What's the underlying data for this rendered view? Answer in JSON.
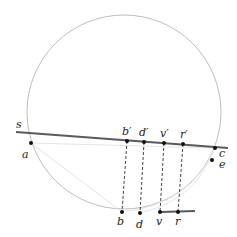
{
  "diagram": {
    "type": "geometric-construction",
    "circle": {
      "cx": 124,
      "cy": 112,
      "r": 97,
      "stroke": "#bdbdbd"
    },
    "thick_lines": [
      {
        "name": "tangent-line-s",
        "x1": 16,
        "y1": 132,
        "x2": 228,
        "y2": 148,
        "stroke": "#5a5a5a"
      },
      {
        "name": "base-segment-vr",
        "x1": 160,
        "y1": 212,
        "x2": 195,
        "y2": 211,
        "stroke": "#5a5a5a"
      }
    ],
    "points": [
      {
        "id": "a",
        "label": "a",
        "x": 31,
        "y": 143,
        "lx": 22,
        "ly": 158
      },
      {
        "id": "b_prime",
        "label": "b′",
        "x": 127,
        "y": 141,
        "lx": 122,
        "ly": 135
      },
      {
        "id": "d_prime",
        "label": "d′",
        "x": 144,
        "y": 142,
        "lx": 139,
        "ly": 136
      },
      {
        "id": "v_prime",
        "label": "v′",
        "x": 164,
        "y": 143,
        "lx": 160,
        "ly": 137
      },
      {
        "id": "r_prime",
        "label": "r′",
        "x": 183,
        "y": 144,
        "lx": 180,
        "ly": 138
      },
      {
        "id": "c",
        "label": "c",
        "x": 215,
        "y": 148,
        "lx": 219,
        "ly": 157
      },
      {
        "id": "e",
        "label": "e",
        "x": 212,
        "y": 160,
        "lx": 219,
        "ly": 168
      },
      {
        "id": "b",
        "label": "b",
        "x": 122,
        "y": 212,
        "lx": 117,
        "ly": 225
      },
      {
        "id": "d",
        "label": "d",
        "x": 140,
        "y": 213,
        "lx": 136,
        "ly": 228
      },
      {
        "id": "v",
        "label": "v",
        "x": 160,
        "y": 212,
        "lx": 156,
        "ly": 225
      },
      {
        "id": "r",
        "label": "r",
        "x": 178,
        "y": 212,
        "lx": 175,
        "ly": 225
      }
    ],
    "labels_extra": [
      {
        "id": "s",
        "label": "s",
        "x": 16,
        "y": 128
      }
    ],
    "dashed_lines": [
      {
        "from": "b_prime",
        "to": "b"
      },
      {
        "from": "d_prime",
        "to": "d"
      },
      {
        "from": "v_prime",
        "to": "v"
      },
      {
        "from": "r_prime",
        "to": "r"
      }
    ],
    "faint_lines": [
      {
        "x1": 31,
        "y1": 143,
        "x2": 215,
        "y2": 148
      },
      {
        "x1": 31,
        "y1": 143,
        "x2": 122,
        "y2": 212
      }
    ],
    "faint_arcs": [
      "M 122 212 Q 190 205 215 148",
      "M 140 213 Q 195 200 213 152"
    ]
  }
}
